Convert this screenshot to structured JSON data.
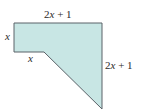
{
  "figure": {
    "type": "polygon",
    "fill_color": "#c8e6e4",
    "stroke_color": "#5a6268",
    "vertices": [
      [
        14,
        23
      ],
      [
        102,
        23
      ],
      [
        102,
        109
      ],
      [
        44,
        52
      ],
      [
        14,
        52
      ]
    ]
  },
  "labels": {
    "top": {
      "coef": "2",
      "var": "x",
      "rest": " + 1"
    },
    "right": {
      "coef": "2",
      "var": "x",
      "rest": " + 1"
    },
    "left": {
      "var": "x"
    },
    "bottom": {
      "var": "x"
    }
  }
}
